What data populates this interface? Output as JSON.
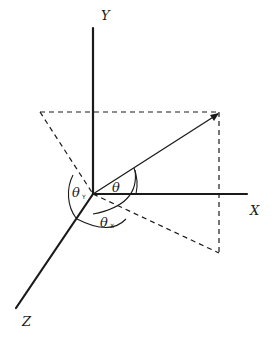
{
  "diagram": {
    "type": "3d-direction-angles",
    "axes": {
      "x_label": "X",
      "y_label": "Y",
      "z_label": "Z"
    },
    "angles": {
      "theta": "θ",
      "theta_y": {
        "symbol": "θ",
        "subscript": "Y"
      },
      "theta_x": {
        "symbol": "θ",
        "subscript": "X"
      }
    },
    "colors": {
      "ink": "#1a1a1a",
      "background": "#ffffff"
    }
  }
}
